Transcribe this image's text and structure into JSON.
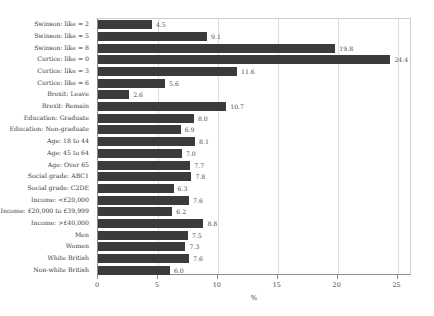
{
  "chart_data": {
    "type": "bar",
    "orientation": "horizontal",
    "title": "",
    "subtitle": "",
    "xlabel": "%",
    "ylabel": "",
    "xlim": [
      0,
      26.2
    ],
    "xticks": [
      0,
      5,
      10,
      15,
      20,
      25
    ],
    "xtick_labels": [
      "0",
      "5",
      "10",
      "15",
      "20",
      "25"
    ],
    "grid": true,
    "grid_axis": "x",
    "legend": false,
    "legend_position": "none",
    "bar_color": "#3b3b3b",
    "categories": [
      "Swinson: like = 2",
      "Swinson: like = 5",
      "Swinson: like = 8",
      "Curtice: like = 0",
      "Curtice: like = 3",
      "Curtice: like = 6",
      "Brexit: Leave",
      "Brexit: Remain",
      "Education: Graduate",
      "Education: Non-graduate",
      "Age: 18 to 44",
      "Age: 45 to 64",
      "Age: Over 65",
      "Social grade: ABC1",
      "Social grade: C2DE",
      "Income: <£20,000",
      "Income: £20,000 to £39,999",
      "Income: >£40,000",
      "Men",
      "Women",
      "White British",
      "Non-white British"
    ],
    "values": [
      4.5,
      9.1,
      19.8,
      24.4,
      11.6,
      5.6,
      2.6,
      10.7,
      8.0,
      6.9,
      8.1,
      7.0,
      7.7,
      7.8,
      6.3,
      7.6,
      6.2,
      8.8,
      7.5,
      7.3,
      7.6,
      6.0
    ],
    "value_labels": [
      "4.5",
      "9.1",
      "19.8",
      "24.4",
      "11.6",
      "5.6",
      "2.6",
      "10.7",
      "8.0",
      "6.9",
      "8.1",
      "7.0",
      "7.7",
      "7.8",
      "6.3",
      "7.6",
      "6.2",
      "8.8",
      "7.5",
      "7.3",
      "7.6",
      "6.0"
    ]
  }
}
